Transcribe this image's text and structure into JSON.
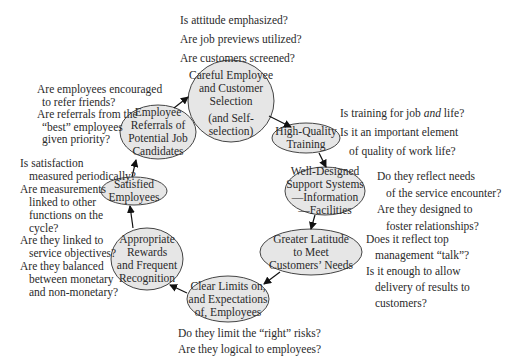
{
  "nodes": {
    "careful": {
      "lines": [
        "Careful Employee",
        "and Customer",
        "Selection",
        "(and Self-",
        "selection)"
      ]
    },
    "training": {
      "lines": [
        "High-Quality",
        "Training"
      ]
    },
    "support": {
      "lines": [
        "Well-Designed",
        "Support Systems",
        "—Information",
        "—Facilities"
      ]
    },
    "latitude": {
      "lines": [
        "Greater Latitude",
        "to Meet",
        "Customers’ Needs"
      ]
    },
    "limits": {
      "lines": [
        "Clear Limits on,",
        "and Expectations",
        "of, Employees"
      ]
    },
    "rewards": {
      "lines": [
        "Appropriate",
        "Rewards",
        "and Frequent",
        "Recognition"
      ]
    },
    "satisfied": {
      "lines": [
        "Satisfied",
        "Employees"
      ]
    },
    "referrals": {
      "lines": [
        "Employee",
        "Referrals of",
        "Potential Job",
        "Candidates"
      ]
    }
  },
  "questions": {
    "careful": [
      "Is attitude emphasized?",
      "Are job previews utilized?",
      "Are customers screened?"
    ],
    "training": [
      "Is training for job ",
      "and",
      " life?",
      "Is it an important element",
      "of quality of work life?"
    ],
    "support": [
      "Do they reflect needs",
      "of the service encounter?",
      "Are they designed to",
      "foster relationships?"
    ],
    "latitude": [
      "Does it reflect top",
      "management “talk”?",
      "Is it enough to allow",
      "delivery of results to",
      "customers?"
    ],
    "limits": [
      "Do they limit the “right” risks?",
      "Are they logical to employees?"
    ],
    "satisfied": [
      "Is satisfaction",
      "measured periodically?",
      "Are measurements",
      "linked to other",
      "functions on the",
      "cycle?",
      "Are they linked to",
      "service objectives?",
      "Are they balanced",
      "between monetary",
      "and non-monetary?"
    ],
    "referrals": [
      "Are employees encouraged",
      "to refer friends?",
      "Are referrals from the",
      "“best” employees",
      "given priority?"
    ]
  },
  "colors": {
    "ellipse_fill": "#e6e6e6",
    "ellipse_stroke": "#444444",
    "arrow": "#111111"
  }
}
